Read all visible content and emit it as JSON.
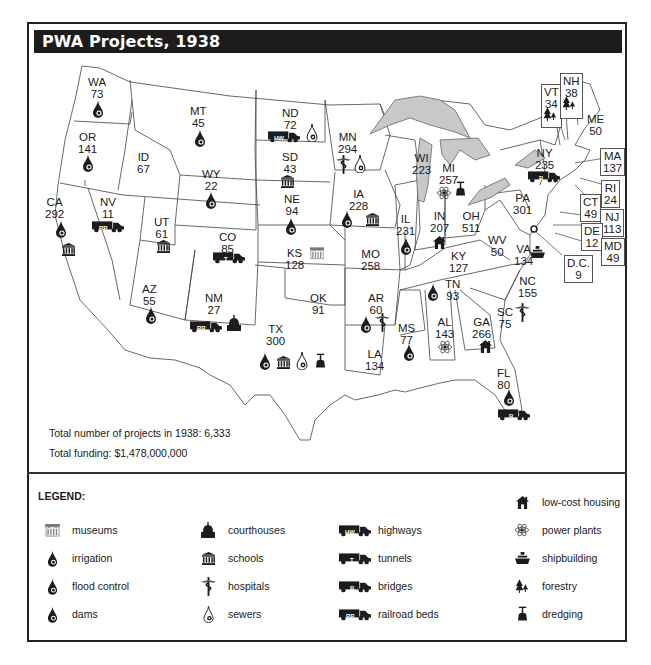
{
  "title": "PWA Projects, 1938",
  "states": [
    {
      "abbr": "WA",
      "count": "73",
      "icons": [
        "dams"
      ]
    },
    {
      "abbr": "OR",
      "count": "141",
      "icons": [
        "dams"
      ]
    },
    {
      "abbr": "CA",
      "count": "292",
      "icons": [
        "irrigation",
        "schools"
      ]
    },
    {
      "abbr": "ID",
      "count": "67",
      "icons": []
    },
    {
      "abbr": "NV",
      "count": "11",
      "icons": [
        "railroad-beds"
      ]
    },
    {
      "abbr": "MT",
      "count": "45",
      "icons": [
        "dams"
      ]
    },
    {
      "abbr": "WY",
      "count": "22",
      "icons": [
        "irrigation"
      ]
    },
    {
      "abbr": "UT",
      "count": "61",
      "icons": [
        "schools"
      ]
    },
    {
      "abbr": "CO",
      "count": "85",
      "icons": [
        "tunnels"
      ]
    },
    {
      "abbr": "AZ",
      "count": "55",
      "icons": [
        "dams"
      ]
    },
    {
      "abbr": "NM",
      "count": "27",
      "icons": [
        "railroad-beds",
        "courthouses"
      ]
    },
    {
      "abbr": "ND",
      "count": "72",
      "icons": [
        "highways",
        "sewers"
      ]
    },
    {
      "abbr": "SD",
      "count": "43",
      "icons": [
        "schools"
      ]
    },
    {
      "abbr": "NE",
      "count": "94",
      "icons": [
        "dams"
      ]
    },
    {
      "abbr": "KS",
      "count": "128",
      "icons": [
        "museums"
      ]
    },
    {
      "abbr": "OK",
      "count": "91",
      "icons": []
    },
    {
      "abbr": "TX",
      "count": "300",
      "icons": [
        "flood-control",
        "schools",
        "sewers",
        "dredging"
      ]
    },
    {
      "abbr": "MN",
      "count": "294",
      "icons": [
        "hospitals",
        "sewers"
      ]
    },
    {
      "abbr": "IA",
      "count": "228",
      "icons": [
        "flood-control",
        "schools"
      ]
    },
    {
      "abbr": "MO",
      "count": "258",
      "icons": []
    },
    {
      "abbr": "AR",
      "count": "60",
      "icons": [
        "flood-control",
        "hospitals"
      ]
    },
    {
      "abbr": "LA",
      "count": "134",
      "icons": []
    },
    {
      "abbr": "WI",
      "count": "223",
      "icons": []
    },
    {
      "abbr": "IL",
      "count": "231",
      "icons": [
        "flood-control"
      ]
    },
    {
      "abbr": "MI",
      "count": "257",
      "icons": [
        "power-plants",
        "dredging"
      ]
    },
    {
      "abbr": "IN",
      "count": "207",
      "icons": [
        "low-cost-housing"
      ]
    },
    {
      "abbr": "OH",
      "count": "511",
      "icons": []
    },
    {
      "abbr": "KY",
      "count": "127",
      "icons": []
    },
    {
      "abbr": "TN",
      "count": "93",
      "icons": [
        "flood-control"
      ]
    },
    {
      "abbr": "MS",
      "count": "77",
      "icons": [
        "flood-control"
      ]
    },
    {
      "abbr": "AL",
      "count": "143",
      "icons": [
        "power-plants"
      ]
    },
    {
      "abbr": "GA",
      "count": "266",
      "icons": [
        "low-cost-housing"
      ]
    },
    {
      "abbr": "FL",
      "count": "80",
      "icons": [
        "flood-control",
        "bridges"
      ]
    },
    {
      "abbr": "SC",
      "count": "75",
      "icons": [
        "hospitals"
      ]
    },
    {
      "abbr": "NC",
      "count": "155",
      "icons": []
    },
    {
      "abbr": "VA",
      "count": "134",
      "icons": [
        "shipbuilding"
      ]
    },
    {
      "abbr": "WV",
      "count": "50",
      "icons": []
    },
    {
      "abbr": "PA",
      "count": "301",
      "icons": []
    },
    {
      "abbr": "NY",
      "count": "235",
      "icons": [
        "bridges"
      ]
    },
    {
      "abbr": "VT",
      "count": "34",
      "icons": [
        "forestry"
      ]
    },
    {
      "abbr": "NH",
      "count": "38",
      "icons": [
        "forestry"
      ]
    },
    {
      "abbr": "ME",
      "count": "50",
      "icons": []
    },
    {
      "abbr": "MA",
      "count": "137",
      "icons": []
    },
    {
      "abbr": "RI",
      "count": "24",
      "icons": []
    },
    {
      "abbr": "CT",
      "count": "49",
      "icons": []
    },
    {
      "abbr": "NJ",
      "count": "113",
      "icons": []
    },
    {
      "abbr": "DE",
      "count": "12",
      "icons": []
    },
    {
      "abbr": "MD",
      "count": "49",
      "icons": []
    },
    {
      "abbr": "D.C.",
      "count": "9",
      "icons": []
    }
  ],
  "totals": {
    "projects": "Total number of projects in 1938:  6,333",
    "funding": "Total funding:  $1,478,000,000"
  },
  "legend": {
    "title": "LEGEND:",
    "items": [
      {
        "key": "museums",
        "label": "museums"
      },
      {
        "key": "irrigation",
        "label": "irrigation"
      },
      {
        "key": "flood-control",
        "label": "flood control"
      },
      {
        "key": "dams",
        "label": "dams"
      },
      {
        "key": "courthouses",
        "label": "courthouses"
      },
      {
        "key": "schools",
        "label": "schools"
      },
      {
        "key": "hospitals",
        "label": "hospitals"
      },
      {
        "key": "sewers",
        "label": "sewers"
      },
      {
        "key": "highways",
        "label": "highways"
      },
      {
        "key": "tunnels",
        "label": "tunnels"
      },
      {
        "key": "bridges",
        "label": "bridges"
      },
      {
        "key": "railroad-beds",
        "label": "railroad beds"
      },
      {
        "key": "low-cost-housing",
        "label": "low-cost housing"
      },
      {
        "key": "power-plants",
        "label": "power plants"
      },
      {
        "key": "shipbuilding",
        "label": "shipbuilding"
      },
      {
        "key": "forestry",
        "label": "forestry"
      },
      {
        "key": "dredging",
        "label": "dredging"
      }
    ],
    "truck_codes": {
      "highways": "HW",
      "tunnels": "T",
      "bridges": "B",
      "railroad-beds": "RR"
    },
    "drop_codes": {
      "irrigation": "I",
      "flood-control": "F",
      "dams": "D",
      "sewers": "S"
    }
  },
  "colors": {
    "ink": "#1c1c1c",
    "lakes": "#c8c8c8",
    "frame": "#222222",
    "box_border": "#555555"
  }
}
